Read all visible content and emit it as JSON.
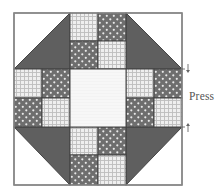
{
  "diagram": {
    "type": "quilt-block-pressing-diagram",
    "label": "Press",
    "colors": {
      "background": "#ffffff",
      "outline": "#444444",
      "outer_border": "#8a8a8a",
      "dark_triangle": "#5f5f5f",
      "dot_fabric_base": "#6e6e6e",
      "dot_fabric_dots": "#e8e8e8",
      "check_fabric_base": "#efefef",
      "check_fabric_lines": "#bdbdbd",
      "center_fabric": "#f7f7f7",
      "arrow": "#666666",
      "label": "#555555"
    },
    "grid": {
      "columns": 6,
      "rows": 6,
      "cell_size": 28,
      "origin": [
        14,
        13
      ]
    },
    "corners": [
      {
        "position": "top-left",
        "dark_half": "lower-right"
      },
      {
        "position": "top-right",
        "dark_half": "lower-left"
      },
      {
        "position": "bottom-left",
        "dark_half": "upper-right"
      },
      {
        "position": "bottom-right",
        "dark_half": "upper-left"
      }
    ],
    "four_patches": [
      {
        "position": "top",
        "cells": [
          [
            "check",
            "dot"
          ],
          [
            "dot",
            "check"
          ]
        ]
      },
      {
        "position": "left",
        "cells": [
          [
            "check",
            "dot"
          ],
          [
            "dot",
            "check"
          ]
        ]
      },
      {
        "position": "right",
        "cells": [
          [
            "check",
            "dot"
          ],
          [
            "dot",
            "check"
          ]
        ]
      },
      {
        "position": "bottom",
        "cells": [
          [
            "check",
            "dot"
          ],
          [
            "dot",
            "check"
          ]
        ]
      }
    ],
    "center": {
      "fabric": "plain-light"
    },
    "arrows": [
      {
        "direction": "down",
        "symbol": "↓",
        "row_line": 2
      },
      {
        "direction": "up",
        "symbol": "↑",
        "row_line": 4
      }
    ]
  }
}
